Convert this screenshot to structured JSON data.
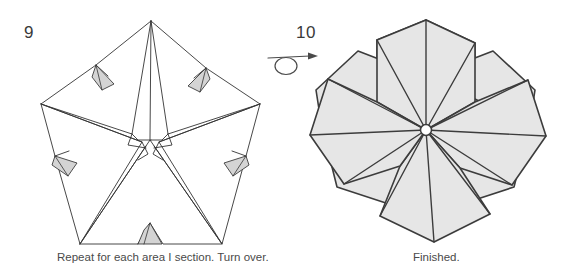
{
  "page": {
    "width": 566,
    "height": 280,
    "background_color": "#ffffff",
    "kind": "origami-instruction-diagram"
  },
  "steps": [
    {
      "number": "9",
      "caption": "Repeat for each area I section. Turn over.",
      "figure_name": "pinwheel-pentagon-folded",
      "fill_color": "#ffffff",
      "stroke_color": "#333333",
      "tab_fill_color": "#d4d4d4"
    },
    {
      "number": "10",
      "caption": "Finished.",
      "figure_name": "five-petal-flower",
      "fill_color": "#e6e6e6",
      "stroke_color": "#3c3c3c",
      "center_hub_color": "#ffffff"
    }
  ],
  "symbols": {
    "turn_over_arrow": {
      "name": "turn-over-loop-arrow",
      "stroke_color": "#4a4a4a"
    }
  },
  "colors": {
    "ink": "#333333",
    "text": "#4a4a4a",
    "step_number": "#3a3a3a",
    "petal_gray": "#e6e6e6",
    "tab_gray": "#d4d4d4",
    "paper_white": "#ffffff"
  }
}
